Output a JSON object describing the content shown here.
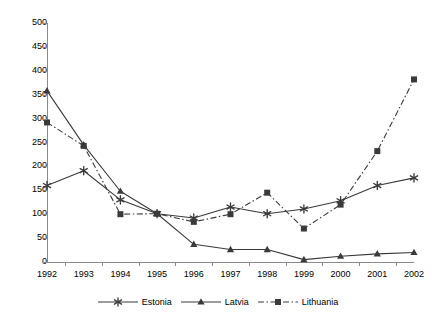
{
  "chart_data": {
    "type": "line",
    "title": "",
    "xlabel": "",
    "ylabel": "",
    "categories": [
      "1992",
      "1993",
      "1994",
      "1995",
      "1996",
      "1997",
      "1998",
      "1999",
      "2000",
      "2001",
      "2002"
    ],
    "ylim": [
      0,
      500
    ],
    "xlim_categories": [
      "1992",
      "2002"
    ],
    "y_ticks": [
      0,
      50,
      100,
      150,
      200,
      250,
      300,
      350,
      400,
      450,
      500
    ],
    "grid": false,
    "legend_position": "bottom",
    "series": [
      {
        "name": "Estonia",
        "marker": "asterisk",
        "line_style": "solid",
        "color": "#3a3a3a",
        "values": [
          160,
          191,
          130,
          101,
          92,
          115,
          101,
          111,
          128,
          160,
          176
        ]
      },
      {
        "name": "Latvia",
        "marker": "triangle",
        "line_style": "solid",
        "color": "#3a3a3a",
        "values": [
          358,
          245,
          148,
          101,
          37,
          26,
          26,
          5,
          12,
          17,
          20
        ]
      },
      {
        "name": "Lithuania",
        "marker": "square",
        "line_style": "dash-dot",
        "color": "#3a3a3a",
        "values": [
          292,
          243,
          100,
          101,
          84,
          100,
          145,
          70,
          120,
          232,
          382
        ]
      }
    ]
  },
  "axes": {
    "y_tick_labels": [
      "500",
      "450",
      "400",
      "350",
      "300",
      "250",
      "200",
      "150",
      "100",
      "50",
      "0"
    ],
    "x_tick_labels": [
      "1992",
      "1993",
      "1994",
      "1995",
      "1996",
      "1997",
      "1998",
      "1999",
      "2000",
      "2001",
      "2002"
    ]
  },
  "legend": {
    "entries": [
      {
        "label": "Estonia"
      },
      {
        "label": "Latvia"
      },
      {
        "label": "Lithuania"
      }
    ]
  },
  "style": {
    "axis_color": "#8a8a8a",
    "series_color": "#3a3a3a",
    "background": "#ffffff"
  }
}
